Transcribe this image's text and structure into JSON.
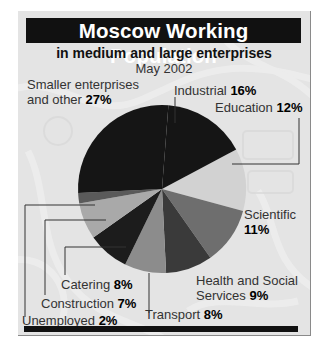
{
  "header": {
    "title": "Moscow Working Population",
    "subtitle": "in medium and large enterprises",
    "date": "May 2002"
  },
  "labels": {
    "smaller_line1": "Smaller enterprises",
    "smaller_line2": "and other",
    "smaller_value": "27%",
    "industrial": "Industrial",
    "industrial_value": "16%",
    "education": "Education",
    "education_value": "12%",
    "scientific": "Scientific",
    "scientific_value": "11%",
    "health_line1": "Health and Social",
    "health_line2": "Services",
    "health_value": "9%",
    "transport": "Transport",
    "transport_value": "8%",
    "catering": "Catering",
    "catering_value": "8%",
    "construction": "Construction",
    "construction_value": "7%",
    "unemployed": "Unemployed",
    "unemployed_value": "2%"
  },
  "colors": {
    "title_bg": "#111111",
    "background": "#e6e6e6",
    "smaller": "#151515",
    "industrial": "#151515",
    "education": "#d2d2d2",
    "scientific": "#6e6e6e",
    "health": "#3a3a3a",
    "transport": "#8c8c8c",
    "catering": "#1c1c1c",
    "construction": "#a9a9a9",
    "unemployed": "#5a5a5a"
  },
  "chart_data": {
    "type": "pie",
    "title": "Moscow Working Population",
    "subtitle": "in medium and large enterprises — May 2002",
    "categories": [
      "Smaller enterprises and other",
      "Industrial",
      "Education",
      "Scientific",
      "Health and Social Services",
      "Transport",
      "Catering",
      "Construction",
      "Unemployed"
    ],
    "values": [
      27,
      16,
      12,
      11,
      9,
      8,
      8,
      7,
      2
    ],
    "unit": "%",
    "legend": "none (direct labels with leader lines)"
  }
}
